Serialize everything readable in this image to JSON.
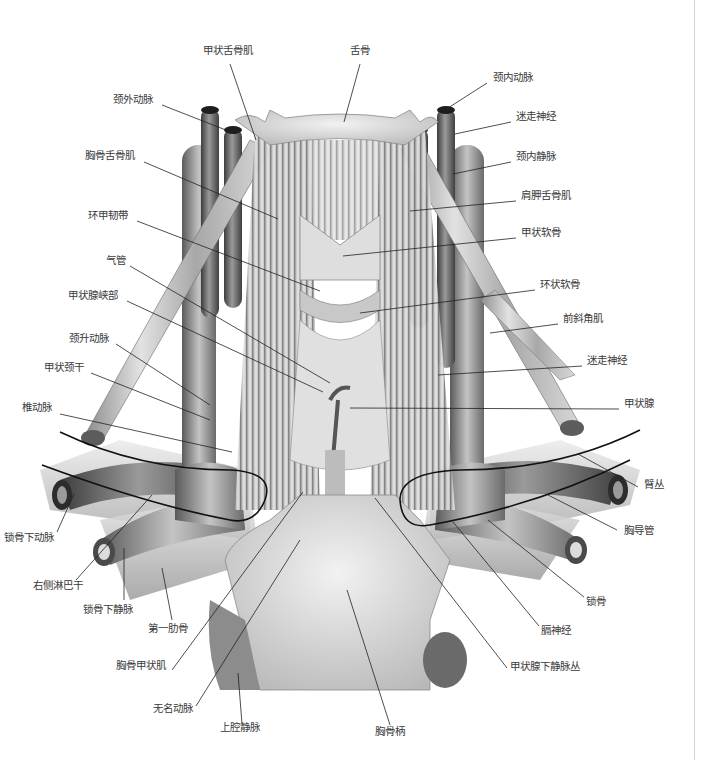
{
  "figure": {
    "colors": {
      "background": "#ffffff",
      "label": "#3a3a3a",
      "leader": "#222222",
      "border": "#d4d4d4"
    },
    "labels": [
      {
        "id": "thyrohyoid",
        "text": "甲状舌骨肌",
        "x": 203,
        "y": 50,
        "lx1": 230,
        "ly1": 64,
        "lx2": 256,
        "ly2": 140
      },
      {
        "id": "hyoid",
        "text": "舌骨",
        "x": 350,
        "y": 50,
        "lx1": 360,
        "ly1": 64,
        "lx2": 344,
        "ly2": 122
      },
      {
        "id": "ext-carotid",
        "text": "颈外动脉",
        "x": 113,
        "y": 99,
        "lx1": 162,
        "ly1": 105,
        "lx2": 236,
        "ly2": 134
      },
      {
        "id": "int-carotid",
        "text": "颈内动脉",
        "x": 493,
        "y": 77,
        "lx1": 487,
        "ly1": 83,
        "lx2": 448,
        "ly2": 108
      },
      {
        "id": "vagus-top",
        "text": "迷走神经",
        "x": 516,
        "y": 116,
        "lx1": 511,
        "ly1": 122,
        "lx2": 455,
        "ly2": 134
      },
      {
        "id": "sternohyoid",
        "text": "胸骨舌骨肌",
        "x": 85,
        "y": 155,
        "lx1": 144,
        "ly1": 162,
        "lx2": 278,
        "ly2": 219
      },
      {
        "id": "int-jugular",
        "text": "颈内静脉",
        "x": 516,
        "y": 156,
        "lx1": 511,
        "ly1": 162,
        "lx2": 453,
        "ly2": 174
      },
      {
        "id": "omohyoid",
        "text": "肩胛舌骨肌",
        "x": 521,
        "y": 195,
        "lx1": 516,
        "ly1": 201,
        "lx2": 410,
        "ly2": 211
      },
      {
        "id": "cricothyroid-lig",
        "text": "环甲韧带",
        "x": 88,
        "y": 215,
        "lx1": 137,
        "ly1": 221,
        "lx2": 320,
        "ly2": 291
      },
      {
        "id": "thyroid-cart",
        "text": "甲状软骨",
        "x": 521,
        "y": 232,
        "lx1": 516,
        "ly1": 238,
        "lx2": 343,
        "ly2": 256
      },
      {
        "id": "trachea",
        "text": "气管",
        "x": 106,
        "y": 260,
        "lx1": 130,
        "ly1": 266,
        "lx2": 330,
        "ly2": 383
      },
      {
        "id": "cricoid",
        "text": "环状软骨",
        "x": 540,
        "y": 284,
        "lx1": 535,
        "ly1": 290,
        "lx2": 360,
        "ly2": 313
      },
      {
        "id": "isthmus",
        "text": "甲状腺峡部",
        "x": 68,
        "y": 295,
        "lx1": 127,
        "ly1": 301,
        "lx2": 323,
        "ly2": 392
      },
      {
        "id": "ant-scalene",
        "text": "前斜角肌",
        "x": 563,
        "y": 318,
        "lx1": 558,
        "ly1": 324,
        "lx2": 490,
        "ly2": 333
      },
      {
        "id": "asc-cervical",
        "text": "颈升动脉",
        "x": 69,
        "y": 338,
        "lx1": 116,
        "ly1": 344,
        "lx2": 210,
        "ly2": 405
      },
      {
        "id": "vagus-mid",
        "text": "迷走神经",
        "x": 587,
        "y": 360,
        "lx1": 582,
        "ly1": 366,
        "lx2": 438,
        "ly2": 375
      },
      {
        "id": "thyrocervical",
        "text": "甲状颈干",
        "x": 44,
        "y": 367,
        "lx1": 91,
        "ly1": 373,
        "lx2": 210,
        "ly2": 420
      },
      {
        "id": "thyroid",
        "text": "甲状腺",
        "x": 624,
        "y": 403,
        "lx1": 619,
        "ly1": 409,
        "lx2": 350,
        "ly2": 408
      },
      {
        "id": "vertebral",
        "text": "椎动脉",
        "x": 22,
        "y": 407,
        "lx1": 60,
        "ly1": 414,
        "lx2": 232,
        "ly2": 452
      },
      {
        "id": "brachial-plexus",
        "text": "臂丛",
        "x": 644,
        "y": 484,
        "lx1": 638,
        "ly1": 487,
        "lx2": 578,
        "ly2": 454
      },
      {
        "id": "subclavian-art",
        "text": "锁骨下动脉",
        "x": 4,
        "y": 537,
        "lx1": 57,
        "ly1": 532,
        "lx2": 74,
        "ly2": 494
      },
      {
        "id": "thoracic-duct",
        "text": "胸导管",
        "x": 624,
        "y": 530,
        "lx1": 617,
        "ly1": 530,
        "lx2": 548,
        "ly2": 495
      },
      {
        "id": "right-lymph",
        "text": "右侧淋巴干",
        "x": 33,
        "y": 585,
        "lx1": 76,
        "ly1": 580,
        "lx2": 152,
        "ly2": 495
      },
      {
        "id": "subclavian-vein",
        "text": "锁骨下静脉",
        "x": 83,
        "y": 609,
        "lx1": 124,
        "ly1": 600,
        "lx2": 124,
        "ly2": 548
      },
      {
        "id": "clavicle",
        "text": "锁骨",
        "x": 586,
        "y": 601,
        "lx1": 584,
        "ly1": 597,
        "lx2": 488,
        "ly2": 520
      },
      {
        "id": "first-rib",
        "text": "第一肋骨",
        "x": 148,
        "y": 628,
        "lx1": 172,
        "ly1": 620,
        "lx2": 162,
        "ly2": 568
      },
      {
        "id": "phrenic",
        "text": "膈神经",
        "x": 541,
        "y": 630,
        "lx1": 539,
        "ly1": 626,
        "lx2": 453,
        "ly2": 522
      },
      {
        "id": "sternothyroid",
        "text": "胸骨甲状肌",
        "x": 116,
        "y": 665,
        "lx1": 172,
        "ly1": 670,
        "lx2": 303,
        "ly2": 492
      },
      {
        "id": "inf-thyroid-plexus",
        "text": "甲状腺下静脉丛",
        "x": 510,
        "y": 666,
        "lx1": 507,
        "ly1": 668,
        "lx2": 375,
        "ly2": 498
      },
      {
        "id": "brachiocephalic",
        "text": "无名动脉",
        "x": 153,
        "y": 708,
        "lx1": 196,
        "ly1": 706,
        "lx2": 300,
        "ly2": 540
      },
      {
        "id": "svc",
        "text": "上腔静脉",
        "x": 220,
        "y": 727,
        "lx1": 242,
        "ly1": 724,
        "lx2": 238,
        "ly2": 673
      },
      {
        "id": "manubrium",
        "text": "胸骨柄",
        "x": 375,
        "y": 731,
        "lx1": 390,
        "ly1": 725,
        "lx2": 347,
        "ly2": 590
      }
    ]
  }
}
